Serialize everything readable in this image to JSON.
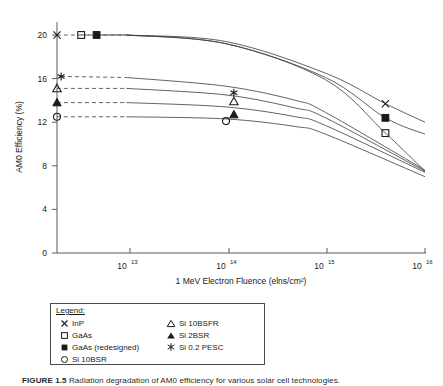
{
  "figure": {
    "caption_label": "FIGURE 1.5",
    "caption_text": "Radiation degradation of AM0 efficiency for various solar cell technologies."
  },
  "legend": {
    "title": "Legend:",
    "left_column": [
      {
        "symbol": "x-marker",
        "label": "InP"
      },
      {
        "symbol": "open-square-marker",
        "label": "GaAs"
      },
      {
        "symbol": "filled-square-marker",
        "label": "GaAs (redesigned)"
      },
      {
        "symbol": "open-circle-marker",
        "label": "Si 10BSR"
      }
    ],
    "right_column": [
      {
        "symbol": "open-triangle-marker",
        "label": "Si 10BSFR"
      },
      {
        "symbol": "filled-triangle-marker",
        "label": "Si 2BSR"
      },
      {
        "symbol": "asterisk-marker",
        "label": "Si 0.2 PESC"
      }
    ]
  },
  "chart_data": {
    "type": "line",
    "title": "",
    "xlabel": "1 MeV Electron Fluence (elns/cm²)",
    "ylabel": "AM0 Efficiency (%)",
    "x_scale": "log",
    "y_scale": "linear",
    "xlim": [
      2000000000000,
      10000000000000000
    ],
    "ylim": [
      0,
      22
    ],
    "y_ticks": [
      0,
      4,
      8,
      12,
      16,
      20
    ],
    "y_tick_labels": [
      "0",
      "4",
      "8",
      "12",
      "16",
      "20"
    ],
    "x_ticks": [
      10000000000000,
      100000000000000,
      1000000000000000,
      10000000000000000
    ],
    "x_tick_labels": [
      "10¹³",
      "10¹⁴",
      "10¹⁵",
      "10¹⁶"
    ],
    "x_tick_mantissa": "10",
    "x_tick_exponents": [
      "13",
      "14",
      "15",
      "16"
    ],
    "grid": false,
    "legend_position": "below-plot",
    "series": [
      {
        "name": "InP",
        "symbol": "x-marker",
        "line_style": "dashed-then-solid",
        "x": [
          2000000000000.0,
          10000000000000.0,
          100000000000000.0,
          1000000000000000.0,
          4000000000000000.0,
          1e+16
        ],
        "y": [
          20.0,
          20.0,
          19.4,
          16.5,
          13.7,
          12.0
        ],
        "marker_points": [
          {
            "x": 2000000000000.0,
            "y": 20.0
          },
          {
            "x": 4000000000000000.0,
            "y": 13.7
          }
        ]
      },
      {
        "name": "GaAs (redesigned)",
        "symbol": "filled-square-marker",
        "line_style": "dashed-then-solid",
        "x": [
          5000000000000.0,
          10000000000000.0,
          100000000000000.0,
          1000000000000000.0,
          4000000000000000.0,
          1e+16
        ],
        "y": [
          20.0,
          20.0,
          19.2,
          16.1,
          12.4,
          10.9
        ],
        "marker_points": [
          {
            "x": 5000000000000.0,
            "y": 20.0
          },
          {
            "x": 4000000000000000.0,
            "y": 12.4
          }
        ]
      },
      {
        "name": "GaAs",
        "symbol": "open-square-marker",
        "line_style": "dashed-then-solid",
        "x": [
          3500000000000.0,
          10000000000000.0,
          100000000000000.0,
          1000000000000000.0,
          4000000000000000.0,
          1e+16
        ],
        "y": [
          20.0,
          20.0,
          19.2,
          15.9,
          11.0,
          7.5
        ],
        "marker_points": [
          {
            "x": 3500000000000.0,
            "y": 20.0
          },
          {
            "x": 4000000000000000.0,
            "y": 11.0
          }
        ]
      },
      {
        "name": "Si 0.2 PESC",
        "symbol": "asterisk-marker",
        "line_style": "dashed-then-solid",
        "x": [
          2200000000000.0,
          10000000000000.0,
          100000000000000.0,
          500000000000000.0,
          1000000000000000.0,
          1e+16
        ],
        "y": [
          16.2,
          16.1,
          15.3,
          14.0,
          12.9,
          7.6
        ],
        "marker_points": [
          {
            "x": 2200000000000.0,
            "y": 16.2
          },
          {
            "x": 120000000000000.0,
            "y": 14.7
          }
        ]
      },
      {
        "name": "Si 10BSFR",
        "symbol": "open-triangle-marker",
        "line_style": "dashed-then-solid",
        "x": [
          2000000000000.0,
          10000000000000.0,
          100000000000000.0,
          500000000000000.0,
          1000000000000000.0,
          1e+16
        ],
        "y": [
          15.1,
          15.1,
          14.5,
          13.3,
          12.4,
          7.5
        ],
        "marker_points": [
          {
            "x": 2000000000000.0,
            "y": 15.1
          },
          {
            "x": 120000000000000.0,
            "y": 13.9
          }
        ]
      },
      {
        "name": "Si 2BSR",
        "symbol": "filled-triangle-marker",
        "line_style": "dashed-then-solid",
        "x": [
          2000000000000.0,
          10000000000000.0,
          100000000000000.0,
          500000000000000.0,
          1000000000000000.0,
          1e+16
        ],
        "y": [
          13.8,
          13.8,
          13.4,
          12.5,
          11.7,
          7.4
        ],
        "marker_points": [
          {
            "x": 2000000000000.0,
            "y": 13.8
          },
          {
            "x": 120000000000000.0,
            "y": 12.7
          }
        ]
      },
      {
        "name": "Si 10BSR",
        "symbol": "open-circle-marker",
        "line_style": "dashed-then-solid",
        "x": [
          2000000000000.0,
          10000000000000.0,
          100000000000000.0,
          500000000000000.0,
          1000000000000000.0,
          1e+16
        ],
        "y": [
          12.5,
          12.5,
          12.3,
          11.6,
          10.9,
          7.0
        ],
        "marker_points": [
          {
            "x": 2000000000000.0,
            "y": 12.5
          },
          {
            "x": 100000000000000.0,
            "y": 12.1
          }
        ]
      }
    ]
  }
}
